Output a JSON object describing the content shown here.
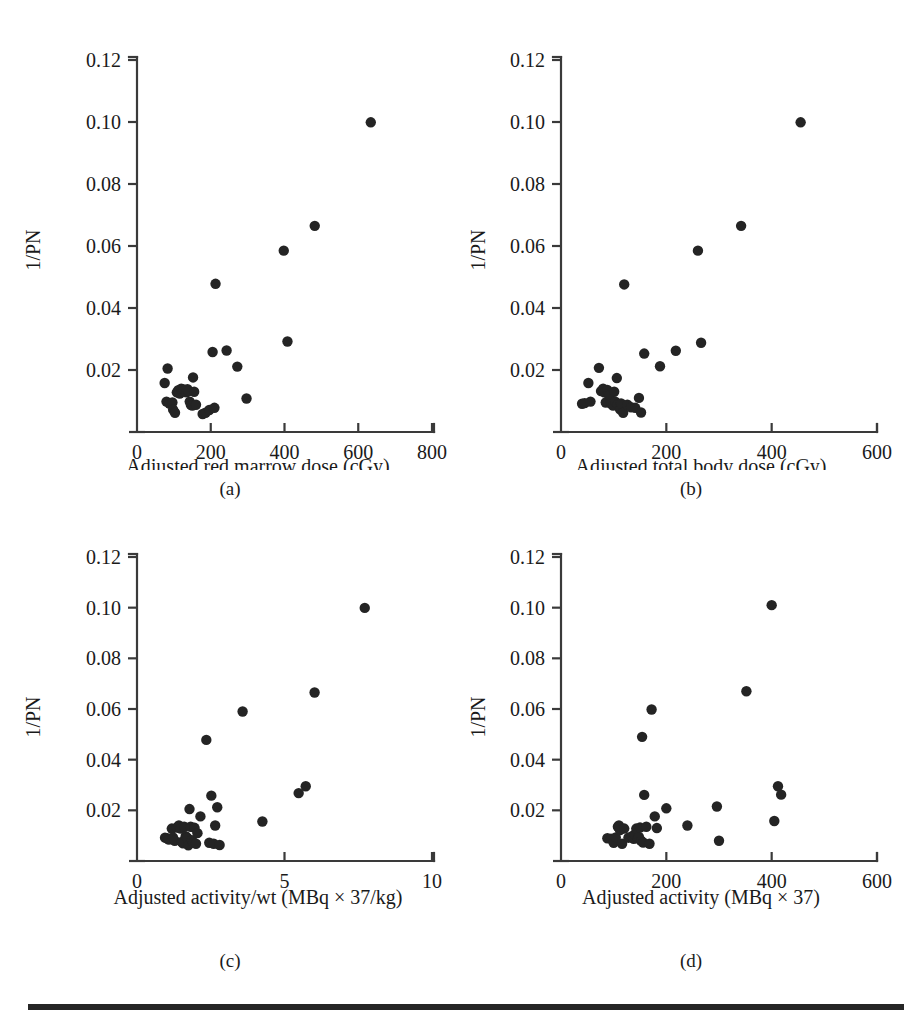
{
  "figure": {
    "panels": [
      {
        "id": "a",
        "caption": "(a)",
        "xlabel": "Adjusted red marrow dose (cGy)",
        "ylabel": "1/PN",
        "xticks": [
          "0",
          "200",
          "400",
          "600",
          "800"
        ],
        "yticks": [
          "0.12",
          "0.10",
          "0.08",
          "0.06",
          "0.04",
          "0.02"
        ]
      },
      {
        "id": "b",
        "caption": "(b)",
        "xlabel": "Adjusted total body dose (cGy)",
        "ylabel": "1/PN",
        "xticks": [
          "0",
          "200",
          "400",
          "600"
        ],
        "yticks": [
          "0.12",
          "0.10",
          "0.08",
          "0.06",
          "0.04",
          "0.02"
        ]
      },
      {
        "id": "c",
        "caption": "(c)",
        "xlabel": "Adjusted activity/wt (MBq × 37/kg)",
        "ylabel": "1/PN",
        "xticks": [
          "0",
          "5",
          "10"
        ],
        "yticks": [
          "0.12",
          "0.10",
          "0.08",
          "0.06",
          "0.04",
          "0.02"
        ]
      },
      {
        "id": "d",
        "caption": "(d)",
        "xlabel": "Adjusted activity (MBq × 37)",
        "ylabel": "1/PN",
        "xticks": [
          "0",
          "200",
          "400",
          "600"
        ],
        "yticks": [
          "0.12",
          "0.10",
          "0.08",
          "0.06",
          "0.04",
          "0.02"
        ]
      }
    ]
  },
  "chart_data": [
    {
      "type": "scatter",
      "panel": "a",
      "title": "",
      "xlabel": "Adjusted red marrow dose (cGy)",
      "ylabel": "1/PN",
      "xlim": [
        0,
        800
      ],
      "ylim": [
        0,
        0.12
      ],
      "xticks": [
        0,
        200,
        400,
        600,
        800
      ],
      "yticks": [
        0.02,
        0.04,
        0.06,
        0.08,
        0.1,
        0.12
      ],
      "grid": false,
      "legend": null,
      "marker": "filled-circle",
      "color": "#242424",
      "points": [
        [
          75,
          0.0158
        ],
        [
          83,
          0.0205
        ],
        [
          80,
          0.0098
        ],
        [
          88,
          0.0092
        ],
        [
          96,
          0.0095
        ],
        [
          98,
          0.0072
        ],
        [
          103,
          0.0062
        ],
        [
          108,
          0.0128
        ],
        [
          112,
          0.0135
        ],
        [
          116,
          0.0124
        ],
        [
          120,
          0.014
        ],
        [
          124,
          0.0131
        ],
        [
          126,
          0.0137
        ],
        [
          130,
          0.0133
        ],
        [
          134,
          0.0128
        ],
        [
          137,
          0.0138
        ],
        [
          140,
          0.0132
        ],
        [
          143,
          0.0098
        ],
        [
          146,
          0.0088
        ],
        [
          150,
          0.0085
        ],
        [
          152,
          0.0176
        ],
        [
          155,
          0.013
        ],
        [
          160,
          0.0088
        ],
        [
          178,
          0.0058
        ],
        [
          186,
          0.0062
        ],
        [
          196,
          0.0071
        ],
        [
          205,
          0.0258
        ],
        [
          210,
          0.0078
        ],
        [
          213,
          0.0478
        ],
        [
          243,
          0.0263
        ],
        [
          272,
          0.0211
        ],
        [
          297,
          0.0108
        ],
        [
          398,
          0.0585
        ],
        [
          408,
          0.0292
        ],
        [
          482,
          0.0665
        ],
        [
          634,
          0.0999
        ]
      ]
    },
    {
      "type": "scatter",
      "panel": "b",
      "title": "",
      "xlabel": "Adjusted total body dose (cGy)",
      "ylabel": "1/PN",
      "xlim": [
        0,
        600
      ],
      "ylim": [
        0,
        0.12
      ],
      "xticks": [
        0,
        200,
        400,
        600
      ],
      "yticks": [
        0.02,
        0.04,
        0.06,
        0.08,
        0.1,
        0.12
      ],
      "grid": false,
      "legend": null,
      "marker": "filled-circle",
      "color": "#242424",
      "points": [
        [
          40,
          0.0091
        ],
        [
          45,
          0.0093
        ],
        [
          52,
          0.0158
        ],
        [
          56,
          0.0098
        ],
        [
          72,
          0.0207
        ],
        [
          76,
          0.0132
        ],
        [
          80,
          0.014
        ],
        [
          82,
          0.0128
        ],
        [
          85,
          0.0095
        ],
        [
          88,
          0.0136
        ],
        [
          90,
          0.0122
        ],
        [
          92,
          0.0118
        ],
        [
          94,
          0.0093
        ],
        [
          96,
          0.009
        ],
        [
          99,
          0.0085
        ],
        [
          101,
          0.013
        ],
        [
          103,
          0.0098
        ],
        [
          106,
          0.0174
        ],
        [
          108,
          0.0089
        ],
        [
          112,
          0.0073
        ],
        [
          114,
          0.0092
        ],
        [
          118,
          0.0062
        ],
        [
          120,
          0.0476
        ],
        [
          126,
          0.0088
        ],
        [
          133,
          0.008
        ],
        [
          141,
          0.0078
        ],
        [
          148,
          0.011
        ],
        [
          152,
          0.0063
        ],
        [
          158,
          0.0253
        ],
        [
          188,
          0.0212
        ],
        [
          218,
          0.0262
        ],
        [
          260,
          0.0585
        ],
        [
          266,
          0.0288
        ],
        [
          342,
          0.0665
        ],
        [
          455,
          0.0999
        ]
      ]
    },
    {
      "type": "scatter",
      "panel": "c",
      "title": "",
      "xlabel": "Adjusted activity/wt (MBq × 37/kg)",
      "ylabel": "1/PN",
      "xlim": [
        0,
        10
      ],
      "ylim": [
        0,
        0.12
      ],
      "xticks": [
        0,
        5,
        10
      ],
      "yticks": [
        0.02,
        0.04,
        0.06,
        0.08,
        0.1,
        0.12
      ],
      "grid": false,
      "legend": null,
      "marker": "filled-circle",
      "color": "#242424",
      "points": [
        [
          0.95,
          0.0092
        ],
        [
          1.02,
          0.009
        ],
        [
          1.08,
          0.0085
        ],
        [
          1.18,
          0.0128
        ],
        [
          1.22,
          0.0093
        ],
        [
          1.28,
          0.008
        ],
        [
          1.35,
          0.0132
        ],
        [
          1.42,
          0.014
        ],
        [
          1.48,
          0.0128
        ],
        [
          1.52,
          0.0075
        ],
        [
          1.56,
          0.007
        ],
        [
          1.6,
          0.0135
        ],
        [
          1.65,
          0.0098
        ],
        [
          1.7,
          0.0092
        ],
        [
          1.74,
          0.0062
        ],
        [
          1.78,
          0.0205
        ],
        [
          1.82,
          0.0135
        ],
        [
          1.86,
          0.0082
        ],
        [
          1.9,
          0.0073
        ],
        [
          1.95,
          0.0131
        ],
        [
          2.0,
          0.0068
        ],
        [
          2.05,
          0.011
        ],
        [
          2.15,
          0.0176
        ],
        [
          2.35,
          0.0478
        ],
        [
          2.45,
          0.0072
        ],
        [
          2.52,
          0.0258
        ],
        [
          2.6,
          0.0068
        ],
        [
          2.65,
          0.014
        ],
        [
          2.72,
          0.0212
        ],
        [
          2.8,
          0.0063
        ],
        [
          3.58,
          0.059
        ],
        [
          4.25,
          0.0156
        ],
        [
          5.48,
          0.0268
        ],
        [
          5.72,
          0.0295
        ],
        [
          6.02,
          0.0665
        ],
        [
          7.72,
          0.0999
        ]
      ]
    },
    {
      "type": "scatter",
      "panel": "d",
      "title": "",
      "xlabel": "Adjusted activity (MBq × 37)",
      "ylabel": "1/PN",
      "xlim": [
        0,
        600
      ],
      "ylim": [
        0,
        0.12
      ],
      "xticks": [
        0,
        200,
        400,
        600
      ],
      "yticks": [
        0.02,
        0.04,
        0.06,
        0.08,
        0.1,
        0.12
      ],
      "grid": false,
      "legend": null,
      "marker": "filled-circle",
      "color": "#242424",
      "points": [
        [
          88,
          0.009
        ],
        [
          95,
          0.0088
        ],
        [
          100,
          0.0072
        ],
        [
          104,
          0.0093
        ],
        [
          108,
          0.0135
        ],
        [
          110,
          0.014
        ],
        [
          112,
          0.0122
        ],
        [
          116,
          0.0068
        ],
        [
          120,
          0.0128
        ],
        [
          128,
          0.0092
        ],
        [
          135,
          0.0098
        ],
        [
          138,
          0.0088
        ],
        [
          140,
          0.0105
        ],
        [
          143,
          0.0128
        ],
        [
          146,
          0.009
        ],
        [
          148,
          0.0095
        ],
        [
          150,
          0.0132
        ],
        [
          152,
          0.008
        ],
        [
          154,
          0.049
        ],
        [
          156,
          0.0073
        ],
        [
          158,
          0.0261
        ],
        [
          162,
          0.0135
        ],
        [
          168,
          0.0068
        ],
        [
          172,
          0.0598
        ],
        [
          178,
          0.0176
        ],
        [
          182,
          0.013
        ],
        [
          200,
          0.0208
        ],
        [
          240,
          0.014
        ],
        [
          296,
          0.0215
        ],
        [
          300,
          0.008
        ],
        [
          352,
          0.067
        ],
        [
          400,
          0.101
        ],
        [
          405,
          0.0158
        ],
        [
          412,
          0.0295
        ],
        [
          418,
          0.0262
        ]
      ]
    }
  ]
}
